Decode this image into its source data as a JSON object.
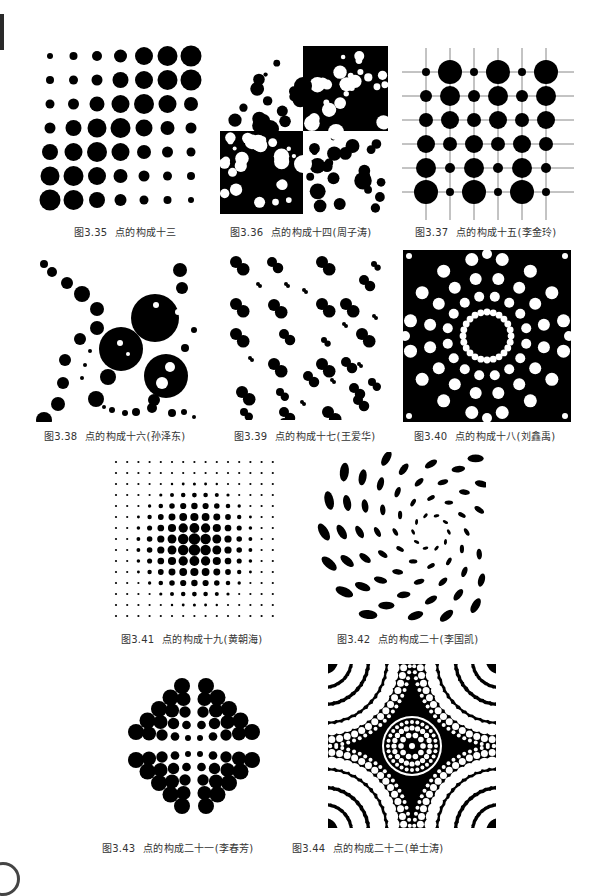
{
  "page": {
    "figures": [
      {
        "id": "fig-3-35",
        "number": "图3.35",
        "title": "点的构成十三",
        "author": ""
      },
      {
        "id": "fig-3-36",
        "number": "图3.36",
        "title": "点的构成十四",
        "author": "(周子涛)"
      },
      {
        "id": "fig-3-37",
        "number": "图3.37",
        "title": "点的构成十五",
        "author": "(李金玲)"
      },
      {
        "id": "fig-3-38",
        "number": "图3.38",
        "title": "点的构成十六",
        "author": "(孙泽东)"
      },
      {
        "id": "fig-3-39",
        "number": "图3.39",
        "title": "点的构成十七",
        "author": "(王爱华)"
      },
      {
        "id": "fig-3-40",
        "number": "图3.40",
        "title": "点的构成十八",
        "author": "(刘鑫禹)"
      },
      {
        "id": "fig-3-41",
        "number": "图3.41",
        "title": "点的构成十九",
        "author": "(黄朝海)"
      },
      {
        "id": "fig-3-42",
        "number": "图3.42",
        "title": "点的构成二十",
        "author": "(李国凯)"
      },
      {
        "id": "fig-3-43",
        "number": "图3.43",
        "title": "点的构成二十一",
        "author": "(李春芳)"
      },
      {
        "id": "fig-3-44",
        "number": "图3.44",
        "title": "点的构成二十二",
        "author": "(单士涛)"
      }
    ]
  },
  "colors": {
    "ink": "#000000",
    "paper": "#ffffff",
    "caption": "#333333",
    "grid_line": "#888888"
  }
}
